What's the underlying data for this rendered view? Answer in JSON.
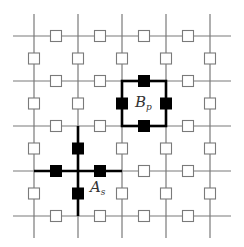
{
  "diagram": {
    "type": "toric-code-lattice",
    "grid": {
      "vertical_lines_x": [
        34,
        78,
        122,
        166,
        210
      ],
      "horizontal_lines_y": [
        36,
        81,
        126,
        171,
        216
      ],
      "x_extent": [
        13,
        231
      ],
      "y_extent": [
        14,
        238
      ],
      "line_color": "#7a7a7a"
    },
    "qubit_marker": {
      "size": 11,
      "open_stroke": "#7a7a7a",
      "filled_color": "#000000"
    },
    "plaquette_operator": {
      "label_main": "B",
      "label_sub": "p",
      "x0": 122,
      "y0": 81,
      "x1": 166,
      "y1": 126,
      "filled_qubits": [
        [
          144,
          81
        ],
        [
          144,
          126
        ],
        [
          122,
          103.5
        ],
        [
          166,
          103.5
        ]
      ]
    },
    "star_operator": {
      "label_main": "A",
      "label_sub": "s",
      "center": [
        78,
        171
      ],
      "h_extent": [
        34,
        122
      ],
      "v_extent": [
        126,
        216
      ],
      "filled_qubits": [
        [
          56,
          171
        ],
        [
          100,
          171
        ],
        [
          78,
          148.5
        ],
        [
          78,
          193.5
        ]
      ]
    },
    "highlight_color": "#000000"
  }
}
